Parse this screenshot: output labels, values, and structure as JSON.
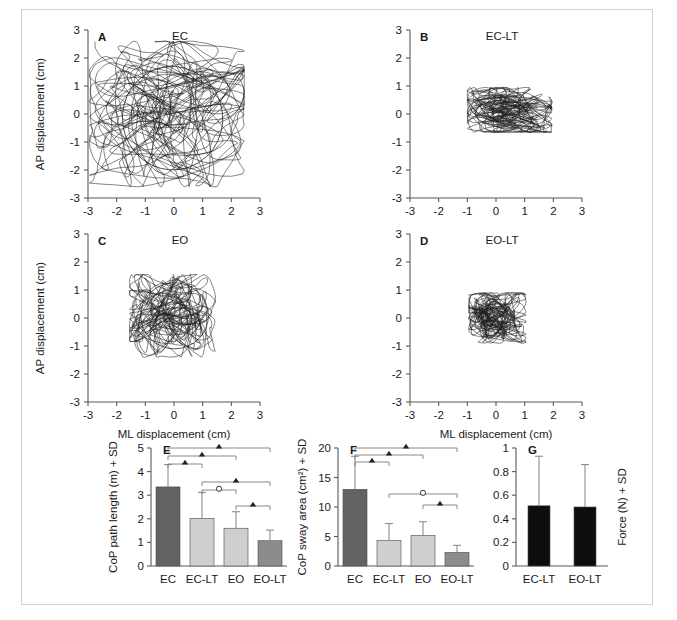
{
  "figure": {
    "panels_letters": [
      "A",
      "B",
      "C",
      "D",
      "E",
      "F",
      "G"
    ],
    "scatter_axis": {
      "x_label": "ML displacement (cm)",
      "y_label": "AP displacement (cm)",
      "x_ticks": [
        "-3",
        "-2",
        "-1",
        "0",
        "1",
        "2",
        "3"
      ],
      "y_ticks": [
        "3",
        "2",
        "1",
        "0",
        "-1",
        "-2",
        "-3"
      ],
      "xlim": [
        -3,
        3
      ],
      "ylim": [
        -3,
        3
      ]
    },
    "panelA": {
      "letter": "A",
      "title": "EC"
    },
    "panelB": {
      "letter": "B",
      "title": "EC-LT"
    },
    "panelC": {
      "letter": "C",
      "title": "EO"
    },
    "panelD": {
      "letter": "D",
      "title": "EO-LT"
    },
    "panelE": {
      "letter": "E"
    },
    "panelF": {
      "letter": "F"
    },
    "panelG": {
      "letter": "G"
    }
  },
  "colors": {
    "bar_dark": "#636363",
    "bar_light": "#cfcfcf",
    "bar_mid": "#8c8c8c",
    "bar_black": "#0d0d0d",
    "axis": "#595959",
    "trace": "#1f1f1f",
    "frame": "#d0d0d0"
  },
  "chart_data": [
    {
      "type": "scatter",
      "panel": "A",
      "title": "EC",
      "xlabel": "ML displacement (cm)",
      "ylabel": "AP displacement (cm)",
      "xlim": [
        -3,
        3
      ],
      "ylim": [
        -3,
        3
      ],
      "xticks": [
        -3,
        -2,
        -1,
        0,
        1,
        2,
        3
      ],
      "yticks": [
        -3,
        -2,
        -1,
        0,
        1,
        2,
        3
      ],
      "grid": false,
      "legend": "none",
      "description": "Centre-of-pressure stabilogram trace, eyes closed; widest sway extent of the four conditions",
      "confidence_ellipse": {
        "cx": -0.05,
        "cy": -0.15,
        "rx": 1.75,
        "ry": 1.85,
        "rotation": -8
      },
      "extent": {
        "x_min": -2.95,
        "x_max": 2.45,
        "y_min": -2.6,
        "y_max": 2.6
      }
    },
    {
      "type": "scatter",
      "panel": "B",
      "title": "EC-LT",
      "xlabel": "ML displacement (cm)",
      "ylabel": "AP displacement (cm)",
      "xlim": [
        -3,
        3
      ],
      "ylim": [
        -3,
        3
      ],
      "xticks": [
        -3,
        -2,
        -1,
        0,
        1,
        2,
        3
      ],
      "yticks": [
        -3,
        -2,
        -1,
        0,
        1,
        2,
        3
      ],
      "grid": false,
      "legend": "none",
      "description": "Centre-of-pressure stabilogram trace, eyes closed with light touch; small flattened cluster",
      "confidence_ellipse": {
        "cx": 0.05,
        "cy": 0.05,
        "rx": 0.78,
        "ry": 0.42,
        "rotation": -3
      },
      "extent": {
        "x_min": -1.0,
        "x_max": 1.95,
        "y_min": -0.65,
        "y_max": 0.95
      }
    },
    {
      "type": "scatter",
      "panel": "C",
      "title": "EO",
      "xlabel": "ML displacement (cm)",
      "ylabel": "AP displacement (cm)",
      "xlim": [
        -3,
        3
      ],
      "ylim": [
        -3,
        3
      ],
      "xticks": [
        -3,
        -2,
        -1,
        0,
        1,
        2,
        3
      ],
      "yticks": [
        -3,
        -2,
        -1,
        0,
        1,
        2,
        3
      ],
      "grid": false,
      "legend": "none",
      "description": "Centre-of-pressure stabilogram trace, eyes open; intermediate sway extent",
      "confidence_ellipse": {
        "cx": 0.02,
        "cy": 0.08,
        "rx": 1.18,
        "ry": 1.18,
        "rotation": 0
      },
      "extent": {
        "x_min": -1.55,
        "x_max": 1.45,
        "y_min": -1.4,
        "y_max": 1.55
      }
    },
    {
      "type": "scatter",
      "panel": "D",
      "title": "EO-LT",
      "xlabel": "ML displacement (cm)",
      "ylabel": "AP displacement (cm)",
      "xlim": [
        -3,
        3
      ],
      "ylim": [
        -3,
        3
      ],
      "xticks": [
        -3,
        -2,
        -1,
        0,
        1,
        2,
        3
      ],
      "yticks": [
        -3,
        -2,
        -1,
        0,
        1,
        2,
        3
      ],
      "grid": false,
      "legend": "none",
      "description": "Centre-of-pressure stabilogram trace, eyes open with light touch; smallest sway extent",
      "confidence_ellipse": {
        "cx": 0.0,
        "cy": 0.05,
        "rx": 0.62,
        "ry": 0.46,
        "rotation": 0
      },
      "extent": {
        "x_min": -0.95,
        "x_max": 1.05,
        "y_min": -0.9,
        "y_max": 0.9
      }
    },
    {
      "type": "bar",
      "panel": "E",
      "title": "",
      "xlabel": "",
      "ylabel": "CoP path length (m) + SD",
      "categories": [
        "EC",
        "EC-LT",
        "EO",
        "EO-LT"
      ],
      "values": [
        3.35,
        2.02,
        1.6,
        1.07
      ],
      "errors": [
        0.95,
        1.1,
        0.7,
        0.45
      ],
      "bar_colors": [
        "#636363",
        "#cfcfcf",
        "#cfcfcf",
        "#8c8c8c"
      ],
      "ylim": [
        0,
        5
      ],
      "yticks": [
        0,
        1,
        2,
        3,
        4,
        5
      ],
      "grid": false,
      "legend": "none",
      "significance": [
        {
          "from": "EC",
          "to": "EC-LT",
          "marker": "triangle",
          "level": 1
        },
        {
          "from": "EC",
          "to": "EO",
          "marker": "triangle",
          "level": 2
        },
        {
          "from": "EC",
          "to": "EO-LT",
          "marker": "triangle",
          "level": 3
        },
        {
          "from": "EC-LT",
          "to": "EO",
          "marker": "circle",
          "level": 4
        },
        {
          "from": "EC-LT",
          "to": "EO-LT",
          "marker": "triangle",
          "level": 5
        },
        {
          "from": "EO",
          "to": "EO-LT",
          "marker": "triangle",
          "level": 6
        }
      ]
    },
    {
      "type": "bar",
      "panel": "F",
      "title": "",
      "xlabel": "",
      "ylabel": "CoP sway area (cm²) + SD",
      "categories": [
        "EC",
        "EC-LT",
        "EO",
        "EO-LT"
      ],
      "values": [
        13.0,
        4.3,
        5.2,
        2.3
      ],
      "errors": [
        5.6,
        2.9,
        2.3,
        1.2
      ],
      "bar_colors": [
        "#636363",
        "#cfcfcf",
        "#cfcfcf",
        "#8c8c8c"
      ],
      "ylim": [
        0,
        20
      ],
      "yticks": [
        0,
        5,
        10,
        15,
        20
      ],
      "grid": false,
      "legend": "none",
      "significance": [
        {
          "from": "EC",
          "to": "EC-LT",
          "marker": "triangle",
          "level": 1
        },
        {
          "from": "EC",
          "to": "EO",
          "marker": "triangle",
          "level": 2
        },
        {
          "from": "EC",
          "to": "EO-LT",
          "marker": "triangle",
          "level": 3
        },
        {
          "from": "EC-LT",
          "to": "EO-LT",
          "marker": "circle",
          "level": 4
        },
        {
          "from": "EO",
          "to": "EO-LT",
          "marker": "triangle",
          "level": 5
        }
      ]
    },
    {
      "type": "bar",
      "panel": "G",
      "title": "",
      "xlabel": "",
      "ylabel": "Force (N) + SD",
      "categories": [
        "EC-LT",
        "EO-LT"
      ],
      "values": [
        0.51,
        0.5
      ],
      "errors": [
        0.42,
        0.36
      ],
      "bar_colors": [
        "#0d0d0d",
        "#0d0d0d"
      ],
      "ylim": [
        0,
        1
      ],
      "yticks": [
        "0",
        "0.2",
        "0.4",
        "0.6",
        "0.8",
        "1"
      ],
      "grid": false,
      "legend": "none",
      "significance": []
    }
  ]
}
